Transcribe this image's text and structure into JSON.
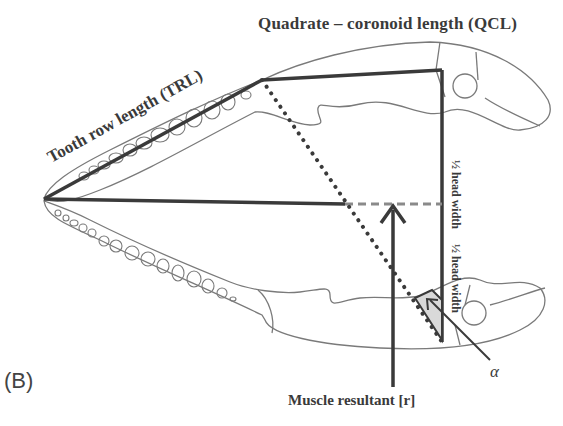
{
  "figure": {
    "panel_label": "(B)",
    "labels": {
      "quadrate_coronoid_length": "Quadrate – coronoid length (QCL)",
      "tooth_row_length": "Tooth row length (TRL)",
      "half_head_width_upper": "½ head width",
      "half_head_width_lower": "½ head width",
      "muscle_resultant": "Muscle resultant [r]",
      "angle": "α"
    },
    "colors": {
      "outline": "#7a7a7a",
      "measurement_line": "#3a3a3a",
      "dashed_line": "#8a8a8a",
      "angle_fill": "#d9d9d9"
    }
  }
}
